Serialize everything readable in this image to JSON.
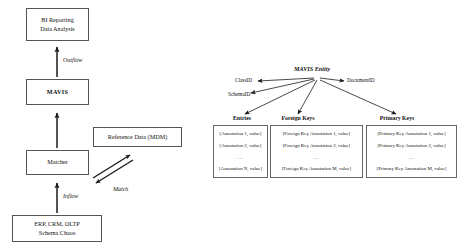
{
  "left_diagram": {
    "nodes": [
      {
        "id": "bi",
        "lines": [
          "BI Reporting",
          "Data Analysis"
        ],
        "bold": false
      },
      {
        "id": "mavis",
        "lines": [
          "MAVIS"
        ],
        "bold": true
      },
      {
        "id": "refdata",
        "lines": [
          "Reference Data (MDM)"
        ],
        "bold": false
      },
      {
        "id": "matcher",
        "lines": [
          "Matcher"
        ],
        "bold": false
      },
      {
        "id": "sources",
        "lines": [
          "ERP, CRM, OLTP",
          "Schema Chaos"
        ],
        "bold": false
      }
    ],
    "edge_labels": [
      {
        "id": "outflow",
        "text": "Outflow"
      },
      {
        "id": "match",
        "text": "Match"
      },
      {
        "id": "inflow",
        "text": "Inflow"
      }
    ]
  },
  "right_diagram": {
    "entity_title": "MAVIS Entity",
    "attributes": [
      {
        "id": "classid",
        "text": "ClassID"
      },
      {
        "id": "schemaid",
        "text": "SchemaID"
      },
      {
        "id": "documentid",
        "text": "DocumentID"
      }
    ],
    "columns": [
      {
        "id": "entries",
        "header": "Entries",
        "rows": [
          "[Annotation 1, value]",
          "[Annotation 2, value]",
          "...",
          "[Annotation N, value]"
        ]
      },
      {
        "id": "foreign-keys",
        "header": "Foreign Keys",
        "rows": [
          "[Foreign Key Annotation 1, value]",
          "[Foreign Key Annotation 2, value]",
          "...",
          "[Foreign Key Annotation M, value]"
        ]
      },
      {
        "id": "primary-keys",
        "header": "Primary Keys",
        "rows": [
          "[Primary Key Annotation 1, value]",
          "[Primary Key Annotation 2, value]",
          "...",
          "[Primary Key Annotation M, value]"
        ]
      }
    ]
  },
  "colors": {
    "background": "#ffffff",
    "box_border": "#555555",
    "text": "#111111",
    "arrow": "#1a1a1a"
  }
}
